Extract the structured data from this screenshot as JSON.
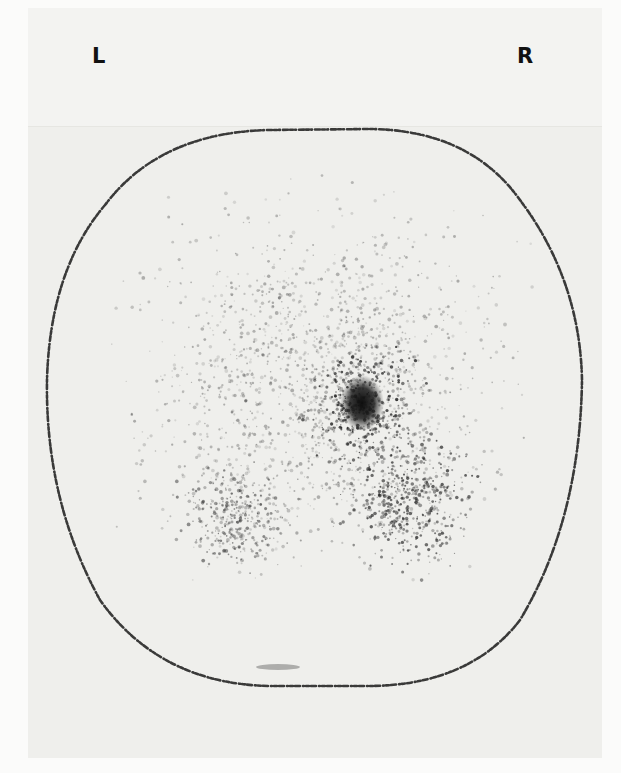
{
  "figure": {
    "type": "scintigraphy-scan",
    "orientation_labels": {
      "left": "L",
      "right": "R"
    },
    "colors": {
      "background": "#fbfbfa",
      "panel": "#efefec",
      "outline": "#1a1a1a",
      "hotspot": "#111111",
      "speckle": "#2a2a2a"
    },
    "outline": {
      "description": "dotted body contour, rounded octagonal",
      "path": "M 105 205 Q 160 132 270 130 L 370 129 Q 470 130 520 200 Q 580 280 582 380 Q 580 520 520 620 Q 470 685 370 686 L 270 686 Q 160 684 100 600 Q 45 500 47 380 Q 50 270 105 205 Z"
    },
    "hotspot": {
      "cx": 362,
      "cy": 403,
      "rx": 22,
      "ry": 28
    },
    "speckle_regions": [
      {
        "cx": 362,
        "cy": 405,
        "rx": 70,
        "ry": 80,
        "count": 420,
        "opacity": 0.85
      },
      {
        "cx": 410,
        "cy": 500,
        "rx": 85,
        "ry": 90,
        "count": 520,
        "opacity": 0.75
      },
      {
        "cx": 235,
        "cy": 520,
        "rx": 80,
        "ry": 70,
        "count": 340,
        "opacity": 0.55
      },
      {
        "cx": 320,
        "cy": 380,
        "rx": 240,
        "ry": 230,
        "count": 1600,
        "opacity": 0.35
      }
    ],
    "artifact": {
      "cx": 278,
      "cy": 667,
      "rx": 22,
      "ry": 3
    }
  }
}
